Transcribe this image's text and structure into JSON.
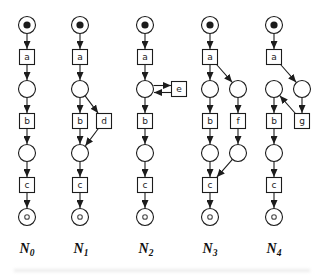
{
  "figure": {
    "background": "#ffffff",
    "stroke_color": "#1c1c1c",
    "label_color": "#111111",
    "end_token_color": "#4a4a4a",
    "place_radius": 8.5,
    "transition_half": 7.5,
    "start_token_radius": 3.6,
    "end_token_radius": 2.3,
    "nets": [
      {
        "id": "N0",
        "label": "N",
        "subscript": "0",
        "label_x": 27,
        "label_y": 253,
        "nodes": [
          {
            "id": "p1",
            "type": "place-start",
            "x": 27,
            "y": 25
          },
          {
            "id": "a",
            "type": "transition",
            "label": "a",
            "x": 27,
            "y": 57
          },
          {
            "id": "p2",
            "type": "place",
            "x": 27,
            "y": 89
          },
          {
            "id": "b",
            "type": "transition",
            "label": "b",
            "x": 27,
            "y": 121
          },
          {
            "id": "p3",
            "type": "place",
            "x": 27,
            "y": 153
          },
          {
            "id": "c",
            "type": "transition",
            "label": "c",
            "x": 27,
            "y": 185
          },
          {
            "id": "p4",
            "type": "place-end",
            "x": 27,
            "y": 217
          }
        ],
        "edges": [
          [
            "p1",
            "a"
          ],
          [
            "a",
            "p2"
          ],
          [
            "p2",
            "b"
          ],
          [
            "b",
            "p3"
          ],
          [
            "p3",
            "c"
          ],
          [
            "c",
            "p4"
          ]
        ]
      },
      {
        "id": "N1",
        "label": "N",
        "subscript": "1",
        "label_x": 81,
        "label_y": 253,
        "nodes": [
          {
            "id": "p1",
            "type": "place-start",
            "x": 80,
            "y": 25
          },
          {
            "id": "a",
            "type": "transition",
            "label": "a",
            "x": 80,
            "y": 57
          },
          {
            "id": "p2",
            "type": "place",
            "x": 80,
            "y": 89
          },
          {
            "id": "b",
            "type": "transition",
            "label": "b",
            "x": 80,
            "y": 121
          },
          {
            "id": "d",
            "type": "transition",
            "label": "d",
            "x": 104,
            "y": 121
          },
          {
            "id": "p3",
            "type": "place",
            "x": 80,
            "y": 153
          },
          {
            "id": "c",
            "type": "transition",
            "label": "c",
            "x": 80,
            "y": 185
          },
          {
            "id": "p4",
            "type": "place-end",
            "x": 80,
            "y": 217
          }
        ],
        "edges": [
          [
            "p1",
            "a"
          ],
          [
            "a",
            "p2"
          ],
          [
            "p2",
            "b"
          ],
          [
            "p2",
            "d"
          ],
          [
            "b",
            "p3"
          ],
          [
            "d",
            "p3"
          ],
          [
            "p3",
            "c"
          ],
          [
            "c",
            "p4"
          ]
        ]
      },
      {
        "id": "N2",
        "label": "N",
        "subscript": "2",
        "label_x": 146,
        "label_y": 253,
        "nodes": [
          {
            "id": "p1",
            "type": "place-start",
            "x": 145,
            "y": 25
          },
          {
            "id": "a",
            "type": "transition",
            "label": "a",
            "x": 145,
            "y": 57
          },
          {
            "id": "p2",
            "type": "place",
            "x": 145,
            "y": 89
          },
          {
            "id": "e",
            "type": "transition",
            "label": "e",
            "x": 179,
            "y": 89
          },
          {
            "id": "b",
            "type": "transition",
            "label": "b",
            "x": 145,
            "y": 121
          },
          {
            "id": "p3",
            "type": "place",
            "x": 145,
            "y": 153
          },
          {
            "id": "c",
            "type": "transition",
            "label": "c",
            "x": 145,
            "y": 185
          },
          {
            "id": "p4",
            "type": "place-end",
            "x": 145,
            "y": 217
          }
        ],
        "edges": [
          [
            "p1",
            "a"
          ],
          [
            "a",
            "p2"
          ],
          [
            "p2",
            "e",
            -3.5
          ],
          [
            "e",
            "p2",
            -3.5
          ],
          [
            "p2",
            "b"
          ],
          [
            "b",
            "p3"
          ],
          [
            "p3",
            "c"
          ],
          [
            "c",
            "p4"
          ]
        ]
      },
      {
        "id": "N3",
        "label": "N",
        "subscript": "3",
        "label_x": 210,
        "label_y": 253,
        "nodes": [
          {
            "id": "p1",
            "type": "place-start",
            "x": 210,
            "y": 25
          },
          {
            "id": "a",
            "type": "transition",
            "label": "a",
            "x": 210,
            "y": 57
          },
          {
            "id": "p2",
            "type": "place",
            "x": 210,
            "y": 89
          },
          {
            "id": "p2r",
            "type": "place",
            "x": 238,
            "y": 89
          },
          {
            "id": "b",
            "type": "transition",
            "label": "b",
            "x": 210,
            "y": 121
          },
          {
            "id": "f",
            "type": "transition",
            "label": "f",
            "x": 238,
            "y": 121
          },
          {
            "id": "p3",
            "type": "place",
            "x": 210,
            "y": 153
          },
          {
            "id": "p3r",
            "type": "place",
            "x": 238,
            "y": 153
          },
          {
            "id": "c",
            "type": "transition",
            "label": "c",
            "x": 210,
            "y": 185
          },
          {
            "id": "p4",
            "type": "place-end",
            "x": 210,
            "y": 217
          }
        ],
        "edges": [
          [
            "p1",
            "a"
          ],
          [
            "a",
            "p2"
          ],
          [
            "a",
            "p2r"
          ],
          [
            "p2",
            "b"
          ],
          [
            "p2r",
            "f"
          ],
          [
            "b",
            "p3"
          ],
          [
            "f",
            "p3r"
          ],
          [
            "p3",
            "c"
          ],
          [
            "p3r",
            "c"
          ],
          [
            "c",
            "p4"
          ]
        ]
      },
      {
        "id": "N4",
        "label": "N",
        "subscript": "4",
        "label_x": 274,
        "label_y": 253,
        "nodes": [
          {
            "id": "p1",
            "type": "place-start",
            "x": 274,
            "y": 25
          },
          {
            "id": "a",
            "type": "transition",
            "label": "a",
            "x": 274,
            "y": 57
          },
          {
            "id": "p2l",
            "type": "place",
            "x": 274,
            "y": 89
          },
          {
            "id": "p2r",
            "type": "place",
            "x": 302,
            "y": 89
          },
          {
            "id": "b",
            "type": "transition",
            "label": "b",
            "x": 274,
            "y": 121
          },
          {
            "id": "g",
            "type": "transition",
            "label": "g",
            "x": 302,
            "y": 121
          },
          {
            "id": "p3",
            "type": "place",
            "x": 274,
            "y": 153
          },
          {
            "id": "c",
            "type": "transition",
            "label": "c",
            "x": 274,
            "y": 185
          },
          {
            "id": "p4",
            "type": "place-end",
            "x": 274,
            "y": 217
          }
        ],
        "edges": [
          [
            "p1",
            "a"
          ],
          [
            "a",
            "p2r"
          ],
          [
            "p2r",
            "g"
          ],
          [
            "g",
            "p2l"
          ],
          [
            "p2l",
            "b"
          ],
          [
            "b",
            "p3"
          ],
          [
            "p3",
            "c"
          ],
          [
            "c",
            "p4"
          ]
        ]
      }
    ]
  }
}
